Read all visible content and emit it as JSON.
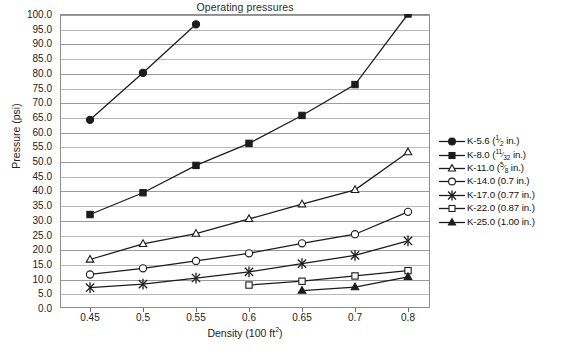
{
  "chart_data": {
    "type": "line",
    "title": "Operating pressures",
    "xlabel": "Density (100 ft2)",
    "xlabel_base": "Density (100 ft",
    "xlabel_sup": "2",
    "xlabel_tail": ")",
    "ylabel": "Pressure (psi)",
    "x": [
      0.45,
      0.5,
      0.55,
      0.6,
      0.65,
      0.7,
      0.8
    ],
    "categories": [
      "0.45",
      "0.5",
      "0.55",
      "0.6",
      "0.65",
      "0.7",
      "0.8"
    ],
    "ylim": [
      0.0,
      100.0
    ],
    "ytick_step": 5.0,
    "yticks": [
      "0.0",
      "5.0",
      "10.0",
      "15.0",
      "20.0",
      "25.0",
      "30.0",
      "35.0",
      "40.0",
      "45.0",
      "50.0",
      "55.0",
      "60.0",
      "65.0",
      "70.0",
      "75.0",
      "80.0",
      "85.0",
      "90.0",
      "95.0",
      "100.0"
    ],
    "grid": "horizontal",
    "legend_position": "right",
    "series": [
      {
        "name": "K-5.6 (1/2 in.)",
        "label_base": "K-5.6 (",
        "frac_num": "1",
        "frac_den": "2",
        "label_tail": " in.)",
        "marker": "filled-circle",
        "x": [
          0.45,
          0.5,
          0.55
        ],
        "values": [
          64.0,
          80.0,
          96.5
        ]
      },
      {
        "name": "K-8.0 (11/32 in.)",
        "label_base": "K-8.0 (",
        "frac_num": "11",
        "frac_den": "32",
        "label_tail": " in.)",
        "marker": "filled-square",
        "x": [
          0.45,
          0.5,
          0.55,
          0.6,
          0.65,
          0.7,
          0.8
        ],
        "values": [
          31.8,
          39.2,
          48.5,
          56.0,
          65.5,
          76.0,
          100.0
        ]
      },
      {
        "name": "K-11.0 (5/8 in.)",
        "label_base": "K-11.0 (",
        "frac_num": "5",
        "frac_den": "8",
        "label_tail": " in.)",
        "marker": "open-triangle",
        "x": [
          0.45,
          0.5,
          0.55,
          0.6,
          0.65,
          0.7,
          0.8
        ],
        "values": [
          16.5,
          21.8,
          25.3,
          30.3,
          35.3,
          40.2,
          53.0
        ]
      },
      {
        "name": "K-14.0 (0.7 in.)",
        "label_base": "K-14.0 (0.7 in.)",
        "frac_num": "",
        "frac_den": "",
        "label_tail": "",
        "marker": "open-circle",
        "x": [
          0.45,
          0.5,
          0.55,
          0.6,
          0.65,
          0.7,
          0.8
        ],
        "values": [
          11.4,
          13.5,
          16.0,
          18.6,
          22.0,
          25.1,
          32.7
        ]
      },
      {
        "name": "K-17.0 (0.77 in.)",
        "label_base": "K-17.0 (0.77 in.)",
        "frac_num": "",
        "frac_den": "",
        "label_tail": "",
        "marker": "asterisk",
        "x": [
          0.45,
          0.5,
          0.55,
          0.6,
          0.65,
          0.7,
          0.8
        ],
        "values": [
          6.9,
          8.1,
          10.2,
          12.3,
          15.1,
          17.9,
          22.8
        ]
      },
      {
        "name": "K-22.0 (0.87 in.)",
        "label_base": "K-22.0 (0.87 in.)",
        "frac_num": "",
        "frac_den": "",
        "label_tail": "",
        "marker": "open-square",
        "x": [
          0.6,
          0.65,
          0.7,
          0.8
        ],
        "values": [
          7.8,
          9.1,
          10.9,
          12.7
        ]
      },
      {
        "name": "K-25.0 (1.00 in.)",
        "label_base": "K-25.0 (1.00 in.)",
        "frac_num": "",
        "frac_den": "",
        "label_tail": "",
        "marker": "filled-triangle",
        "x": [
          0.65,
          0.7,
          0.8
        ],
        "values": [
          5.9,
          7.1,
          10.6
        ]
      }
    ]
  },
  "colors": {
    "line": "#1c1c1c",
    "grid": "#9a9a9a",
    "frame": "#8d8d8d",
    "text": "#1a1a1a",
    "background": "#ffffff"
  }
}
